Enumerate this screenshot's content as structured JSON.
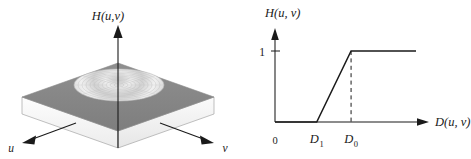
{
  "figure": {
    "type": "two-panel-filter-transfer-function",
    "panels": [
      {
        "id": "perspective-plot",
        "name": "3D perspective plot of filter transfer function",
        "vertical_axis_label": "H(u,v)",
        "axis_u_label": "u",
        "axis_v_label": "v",
        "surface_description": "flat slab at value 1 with a circular depressed region (value 0) at the origin",
        "top_surface_color": "#8a8a8a",
        "hole_fill_color": "#e8e8e8",
        "slab_side_color": "#f2f2f2",
        "slab_front_color": "#fafafa",
        "outline_color": "#9a9a9a"
      },
      {
        "id": "cross-section-plot",
        "name": "2D cross-section plot of filter transfer function",
        "y_axis_label": "H(u, v)",
        "x_axis_label": "D(u, v)",
        "origin_label": "0",
        "y_tick_labels": [
          "1"
        ],
        "x_tick_labels": [
          "D",
          "D"
        ],
        "x_tick_subscripts": [
          "1",
          "0"
        ],
        "line_color": "#1a1a1a",
        "dashed_guide_color": "#1a1a1a"
      }
    ]
  },
  "chart_data": {
    "type": "line",
    "title": "",
    "subtitle": "",
    "xlabel": "D(u, v)",
    "ylabel": "H(u, v)",
    "xlim": [
      0,
      1.6
    ],
    "ylim": [
      0,
      1.25
    ],
    "grid": false,
    "legend": false,
    "x_tick_values": [
      0.0,
      0.45,
      0.82
    ],
    "x_tick_text": [
      "0",
      "D₁",
      "D₀"
    ],
    "y_tick_values": [
      1.0
    ],
    "y_tick_text": [
      "1"
    ],
    "annotations": [
      {
        "text": "dashed vertical guide at D₀ from axis up to H = 1",
        "x": 0.82,
        "y_from": 0.0,
        "y_to": 1.0,
        "style": "dashed"
      }
    ],
    "series": [
      {
        "name": "H(u, v)",
        "x": [
          0.0,
          0.45,
          0.82,
          1.52
        ],
        "values": [
          0.0,
          0.0,
          1.0,
          1.0
        ],
        "description": "zero until D1, linear ramp from D1 to D0, constant 1 beyond D0"
      }
    ]
  }
}
